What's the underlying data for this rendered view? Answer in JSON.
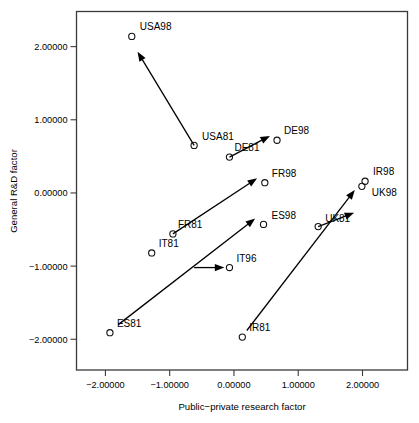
{
  "chart_data": {
    "type": "scatter",
    "title": "",
    "xlabel": "Public−private research factor",
    "ylabel": "General R&D factor",
    "xlim": [
      -2.45,
      2.7
    ],
    "ylim": [
      -2.42,
      2.48
    ],
    "xticks": [
      -2,
      -1,
      0,
      1,
      2
    ],
    "yticks": [
      -2,
      -1,
      0,
      1,
      2
    ],
    "xticklabels": [
      "−2.00000",
      "−1.00000",
      "0.00000",
      "1.00000",
      "2.00000"
    ],
    "yticklabels": [
      "−2.00000",
      "−1.00000",
      "0.00000",
      "1.00000",
      "2.00000"
    ],
    "grid": false,
    "legend": null,
    "marker": "open-circle",
    "points": [
      {
        "label": "USA98",
        "x": -1.59,
        "y": 2.14,
        "label_dx": 8,
        "label_dy": -6
      },
      {
        "label": "USA81",
        "x": -0.62,
        "y": 0.65,
        "label_dx": 8,
        "label_dy": -5
      },
      {
        "label": "DE81",
        "x": -0.07,
        "y": 0.49,
        "label_dx": 5,
        "label_dy": -6
      },
      {
        "label": "DE98",
        "x": 0.67,
        "y": 0.72,
        "label_dx": 7,
        "label_dy": -6
      },
      {
        "label": "FR81",
        "x": -0.95,
        "y": -0.56,
        "label_dx": 5,
        "label_dy": -6
      },
      {
        "label": "FR98",
        "x": 0.48,
        "y": 0.14,
        "label_dx": 7,
        "label_dy": -6
      },
      {
        "label": "IT81",
        "x": -1.28,
        "y": -0.82,
        "label_dx": 7,
        "label_dy": -6
      },
      {
        "label": "IT96",
        "x": -0.07,
        "y": -1.02,
        "label_dx": 7,
        "label_dy": -6
      },
      {
        "label": "ES81",
        "x": -1.93,
        "y": -1.91,
        "label_dx": 7,
        "label_dy": -6
      },
      {
        "label": "ES98",
        "x": 0.46,
        "y": -0.43,
        "label_dx": 8,
        "label_dy": -5
      },
      {
        "label": "IR81",
        "x": 0.13,
        "y": -1.97,
        "label_dx": 7,
        "label_dy": -6
      },
      {
        "label": "IR98",
        "x": 2.04,
        "y": 0.16,
        "label_dx": 8,
        "label_dy": -6
      },
      {
        "label": "UK81",
        "x": 1.31,
        "y": -0.46,
        "label_dx": 7,
        "label_dy": -5
      },
      {
        "label": "UK98",
        "x": 1.99,
        "y": 0.09,
        "label_dx": 10,
        "label_dy": 10
      }
    ],
    "arrows": [
      {
        "name": "USA81-to-USA98",
        "x1": -0.62,
        "y1": 0.65,
        "x2": -1.5,
        "y2": 1.93
      },
      {
        "name": "DE81-to-DE98",
        "x1": -0.07,
        "y1": 0.49,
        "x2": 0.56,
        "y2": 0.78
      },
      {
        "name": "FR81-to-FR98",
        "x1": -0.95,
        "y1": -0.56,
        "x2": 0.36,
        "y2": 0.2
      },
      {
        "name": "IT81-to-IT96",
        "x1": -0.62,
        "y1": -1.02,
        "x2": -0.15,
        "y2": -1.02
      },
      {
        "name": "ES81-to-ES98",
        "x1": -1.8,
        "y1": -1.8,
        "x2": 0.33,
        "y2": -0.35
      },
      {
        "name": "IR81-to-IR98",
        "x1": 0.2,
        "y1": -1.88,
        "x2": 1.88,
        "y2": 0.04
      },
      {
        "name": "UK81-to-UK98",
        "x1": 1.31,
        "y1": -0.46,
        "x2": 1.87,
        "y2": -0.27
      }
    ]
  },
  "axes": {
    "x_label": "Public−private research factor",
    "y_label": "General R&D factor",
    "x_tick_labels": [
      "−2.00000",
      "−1.00000",
      "0.00000",
      "1.00000",
      "2.00000"
    ],
    "y_tick_labels": [
      "2.00000",
      "1.00000",
      "0.00000",
      "−1.00000",
      "−2.00000"
    ]
  },
  "colors": {
    "frame": "#3a3a3a",
    "marker": "#111111",
    "arrow": "#000000",
    "text": "#000000",
    "background": "#ffffff"
  }
}
